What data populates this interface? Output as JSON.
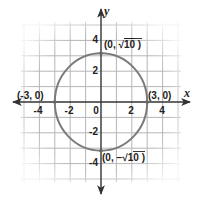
{
  "figure": {
    "type": "coordinate-plane",
    "x_axis_label": "x",
    "y_axis_label": "y",
    "x_ticks": [
      {
        "value": -4,
        "label": "-4"
      },
      {
        "value": -2,
        "label": "-2"
      },
      {
        "value": 0,
        "label": "0"
      },
      {
        "value": 2,
        "label": "2"
      },
      {
        "value": 4,
        "label": "4"
      }
    ],
    "y_ticks": [
      {
        "value": 4,
        "label": "4"
      },
      {
        "value": 2,
        "label": "2"
      },
      {
        "value": -2,
        "label": "-2"
      },
      {
        "value": -4,
        "label": "-4"
      }
    ],
    "grid_range": {
      "x": [
        -5,
        5
      ],
      "y": [
        -5,
        5
      ]
    },
    "curve": {
      "shape": "ellipse",
      "center": [
        0,
        0
      ],
      "x_radius": 3,
      "y_radius": 3.1623,
      "color": "#7a7a7a"
    },
    "points": [
      {
        "id": "top",
        "coords": [
          0,
          3.1623
        ],
        "label_prefix": "(0, ",
        "label_radical": "10",
        "label_suffix": " )"
      },
      {
        "id": "bottom",
        "coords": [
          0,
          -3.1623
        ],
        "label_prefix": "(0, −",
        "label_radical": "10",
        "label_suffix": " )"
      },
      {
        "id": "left",
        "coords": [
          -3,
          0
        ],
        "label": "(-3, 0)"
      },
      {
        "id": "right",
        "coords": [
          3,
          0
        ],
        "label": "(3, 0)"
      }
    ],
    "colors": {
      "axis": "#333333",
      "grid": "#b5b5b5",
      "curve": "#7a7a7a",
      "text": "#222222"
    }
  }
}
